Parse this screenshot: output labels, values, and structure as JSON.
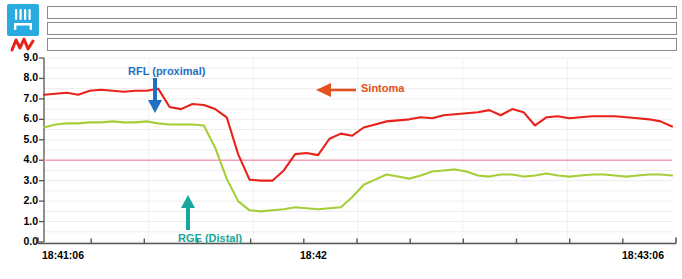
{
  "window": {
    "title": "pH-Impedance Tracing"
  },
  "toolbar": {
    "icon_badge": "impedance-probe-icon",
    "icon_zigzag": "ph-signal-icon",
    "badge_color": "#29ABE2",
    "zigzag_color": "#E8221A"
  },
  "tracks": {
    "label": "impedance-channels",
    "count": 3,
    "items": [
      {
        "name": "impedance-track-1",
        "value": ""
      },
      {
        "name": "impedance-track-2",
        "value": ""
      },
      {
        "name": "impedance-track-3",
        "value": ""
      }
    ]
  },
  "annotations": [
    {
      "id": "rfl",
      "text": "RFL (proximal)",
      "color": "#1F6FC4",
      "arrow": "down"
    },
    {
      "id": "rge",
      "text": "RGE (Distal)",
      "color": "#18A79B",
      "arrow": "up"
    },
    {
      "id": "sintoma",
      "text": "Sintoma",
      "color": "#E2521B",
      "arrow": "left"
    }
  ],
  "chart_data": {
    "type": "line",
    "title": "",
    "xlabel": "",
    "ylabel": "",
    "ylim": [
      0.0,
      9.0
    ],
    "ytick_step": 1.0,
    "yticks": [
      "0.0",
      "1.0",
      "2.0",
      "3.0",
      "4.0",
      "5.0",
      "6.0",
      "7.0",
      "8.0",
      "9.0"
    ],
    "xticks": [
      "18:41:06",
      "18:42",
      "18:43:06"
    ],
    "xtick_positions": [
      0.0,
      0.5,
      1.0
    ],
    "xlim_labels": [
      "18:41:06",
      "18:43:06"
    ],
    "grid": true,
    "grid_color": "#EDEDED",
    "threshold": {
      "name": "ph-4-threshold",
      "value": 4.0,
      "color": "#F6A0B4"
    },
    "legend_position": "none",
    "series": [
      {
        "name": "RFL (proximal)",
        "color": "#E8221A",
        "x": [
          0,
          1,
          2,
          3,
          4,
          5,
          6,
          7,
          8,
          9,
          10,
          11,
          12,
          13,
          14,
          15,
          16,
          17,
          18,
          19,
          20,
          21,
          22,
          23,
          24,
          25,
          26,
          27,
          28,
          29,
          30,
          31,
          32,
          33,
          34,
          35,
          36,
          37,
          38,
          39,
          40,
          41,
          42,
          43,
          44,
          45,
          46,
          47,
          48,
          49,
          50,
          51,
          52,
          53,
          54,
          55
        ],
        "values": [
          7.2,
          7.25,
          7.3,
          7.2,
          7.4,
          7.45,
          7.4,
          7.35,
          7.4,
          7.4,
          7.5,
          6.6,
          6.5,
          6.75,
          6.7,
          6.5,
          6.1,
          4.3,
          3.05,
          3.0,
          3.0,
          3.5,
          4.3,
          4.35,
          4.25,
          5.05,
          5.3,
          5.2,
          5.6,
          5.75,
          5.9,
          5.95,
          6.0,
          6.1,
          6.05,
          6.2,
          6.25,
          6.3,
          6.35,
          6.45,
          6.2,
          6.5,
          6.35,
          5.7,
          6.1,
          6.15,
          6.05,
          6.1,
          6.15,
          6.15,
          6.15,
          6.1,
          6.05,
          6.0,
          5.9,
          5.65
        ]
      },
      {
        "name": "RGE (Distal)",
        "color": "#A6CE39",
        "x": [
          0,
          1,
          2,
          3,
          4,
          5,
          6,
          7,
          8,
          9,
          10,
          11,
          12,
          13,
          14,
          15,
          16,
          17,
          18,
          19,
          20,
          21,
          22,
          23,
          24,
          25,
          26,
          27,
          28,
          29,
          30,
          31,
          32,
          33,
          34,
          35,
          36,
          37,
          38,
          39,
          40,
          41,
          42,
          43,
          44,
          45,
          46,
          47,
          48,
          49,
          50,
          51,
          52,
          53,
          54,
          55
        ],
        "values": [
          5.6,
          5.75,
          5.8,
          5.8,
          5.85,
          5.85,
          5.9,
          5.85,
          5.85,
          5.9,
          5.8,
          5.75,
          5.75,
          5.75,
          5.7,
          4.6,
          3.1,
          2.0,
          1.55,
          1.5,
          1.55,
          1.6,
          1.7,
          1.65,
          1.6,
          1.65,
          1.7,
          2.2,
          2.8,
          3.05,
          3.3,
          3.2,
          3.1,
          3.25,
          3.45,
          3.5,
          3.55,
          3.45,
          3.25,
          3.2,
          3.3,
          3.3,
          3.2,
          3.25,
          3.35,
          3.25,
          3.2,
          3.25,
          3.3,
          3.3,
          3.25,
          3.2,
          3.25,
          3.3,
          3.3,
          3.25
        ]
      }
    ]
  }
}
